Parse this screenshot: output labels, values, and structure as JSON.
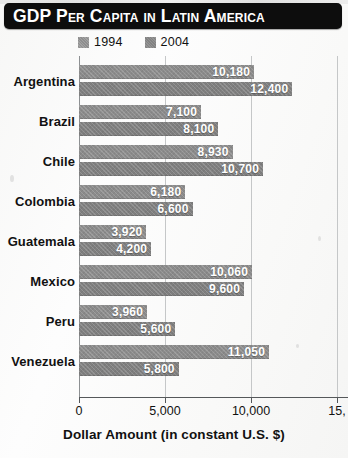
{
  "title": "GDP Per Capita in Latin America",
  "legend": {
    "position": "top-left",
    "entries": [
      {
        "label": "1994",
        "color": "#8e8e8e"
      },
      {
        "label": "2004",
        "color": "#828282"
      }
    ]
  },
  "axis": {
    "x_title": "Dollar Amount (in constant U.S. $)",
    "tick_labels": [
      "0",
      "5,000",
      "10,000",
      "15,"
    ],
    "tick_values": [
      0,
      5000,
      10000,
      15000
    ],
    "note_rightmost_tick_cropped": true
  },
  "chart_data": {
    "type": "bar",
    "orientation": "horizontal",
    "title": "GDP Per Capita in Latin America",
    "xlabel": "Dollar Amount (in constant U.S. $)",
    "ylabel": "",
    "xlim": [
      0,
      15000
    ],
    "grid": true,
    "legend_position": "top-left",
    "categories": [
      "Argentina",
      "Brazil",
      "Chile",
      "Colombia",
      "Guatemala",
      "Mexico",
      "Peru",
      "Venezuela"
    ],
    "series": [
      {
        "name": "1994",
        "values": [
          10180,
          7100,
          8930,
          6180,
          3920,
          10060,
          3960,
          11050
        ],
        "labels": [
          "10,180",
          "7,100",
          "8,930",
          "6,180",
          "3,920",
          "10,060",
          "3,960",
          "11,050"
        ]
      },
      {
        "name": "2004",
        "values": [
          12400,
          8100,
          10700,
          6600,
          4200,
          9600,
          5600,
          5800
        ],
        "labels": [
          "12,400",
          "8,100",
          "10,700",
          "6,600",
          "4,200",
          "9,600",
          "5,600",
          "5,800"
        ]
      }
    ]
  }
}
